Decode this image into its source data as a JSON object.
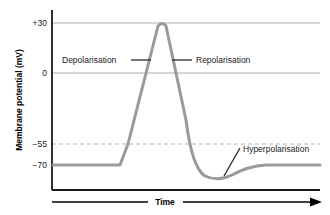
{
  "chart_data": {
    "type": "line",
    "title": "",
    "xlabel": "Time",
    "ylabel": "Membrane potential (mV)",
    "yticks": [
      {
        "label": "+30",
        "value": 30,
        "y": 23,
        "gridline": "solid"
      },
      {
        "label": "0",
        "value": 0,
        "y": 73,
        "gridline": "solid"
      },
      {
        "label": "−55",
        "value": -55,
        "y": 144,
        "gridline": "dashed"
      },
      {
        "label": "−70",
        "value": -70,
        "y": 165,
        "gridline": "none"
      }
    ],
    "ylim": [
      -85,
      40
    ],
    "xlim": [
      0,
      100
    ],
    "grid": true,
    "legend": false,
    "series": [
      {
        "name": "Action potential",
        "color": "#9a9a9a",
        "points": [
          {
            "x": 0,
            "mV": -70
          },
          {
            "x": 25,
            "mV": -70
          },
          {
            "x": 29,
            "mV": -55
          },
          {
            "x": 44,
            "mV": 30
          },
          {
            "x": 47,
            "mV": 30
          },
          {
            "x": 56,
            "mV": -55
          },
          {
            "x": 62,
            "mV": -80
          },
          {
            "x": 70,
            "mV": -84
          },
          {
            "x": 80,
            "mV": -78
          },
          {
            "x": 88,
            "mV": -71
          },
          {
            "x": 100,
            "mV": -70
          }
        ],
        "path": "M 53,165 L 120,165 L 128,144 L 158,26 Q 162,21 166,26 L 186,120 Q 192,168 205,176 Q 218,182 232,175 Q 248,166 266,165 L 320,165"
      }
    ],
    "annotations": [
      {
        "name": "depolarisation",
        "text": "Depolarisation",
        "text_x": 62,
        "text_y": 63,
        "leader": {
          "x1": 131,
          "y1": 60,
          "x2": 151,
          "y2": 60
        }
      },
      {
        "name": "repolarisation",
        "text": "Repolarisation",
        "text_x": 196,
        "text_y": 63,
        "leader": {
          "x1": 172,
          "y1": 60,
          "x2": 192,
          "y2": 60
        }
      },
      {
        "name": "hyperpolarisation",
        "text": "Hyperpolarisation",
        "text_x": 243,
        "text_y": 152,
        "leader": {
          "x1": 240,
          "y1": 148,
          "x2": 224,
          "y2": 176
        }
      }
    ],
    "axes": {
      "y_axis": {
        "x": 52,
        "y_top": 10,
        "y_bottom": 190
      },
      "x_axis": {
        "y": 190,
        "x_left": 52,
        "x_right": 320
      },
      "gridline_right": 320
    },
    "time_arrow": {
      "label": "Time",
      "x_start": 52,
      "x_end": 322,
      "y": 202
    },
    "colors": {
      "curve": "#9a9a9a",
      "gridline": "#c8c8c8",
      "axis": "#1a1a1a",
      "text": "#1a1a1a",
      "background": "#ffffff"
    }
  }
}
